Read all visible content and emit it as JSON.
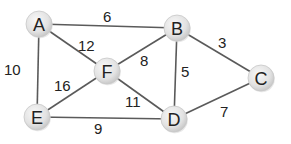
{
  "diagram": {
    "type": "weighted-undirected-graph",
    "node_radius": 13,
    "colors": {
      "edge": "#5a5a5a",
      "node_fill_light": "#f6f6f6",
      "node_fill_dark": "#cfcfcf",
      "text": "#222222"
    },
    "nodes": [
      {
        "id": "A",
        "label": "A",
        "x": 39,
        "y": 24
      },
      {
        "id": "B",
        "label": "B",
        "x": 177,
        "y": 28
      },
      {
        "id": "C",
        "label": "C",
        "x": 261,
        "y": 78
      },
      {
        "id": "F",
        "label": "F",
        "x": 107,
        "y": 71
      },
      {
        "id": "E",
        "label": "E",
        "x": 37,
        "y": 117
      },
      {
        "id": "D",
        "label": "D",
        "x": 174,
        "y": 119
      }
    ],
    "edges": [
      {
        "from": "A",
        "to": "B",
        "weight": "6",
        "label_x": 103,
        "label_y": 22
      },
      {
        "from": "A",
        "to": "F",
        "weight": "12",
        "label_x": 78,
        "label_y": 51
      },
      {
        "from": "A",
        "to": "E",
        "weight": "10",
        "label_x": 4,
        "label_y": 75
      },
      {
        "from": "B",
        "to": "F",
        "weight": "8",
        "label_x": 140,
        "label_y": 66
      },
      {
        "from": "B",
        "to": "C",
        "weight": "3",
        "label_x": 218,
        "label_y": 48
      },
      {
        "from": "B",
        "to": "D",
        "weight": "5",
        "label_x": 181,
        "label_y": 77
      },
      {
        "from": "F",
        "to": "E",
        "weight": "16",
        "label_x": 54,
        "label_y": 91
      },
      {
        "from": "F",
        "to": "D",
        "weight": "11",
        "label_x": 125,
        "label_y": 107
      },
      {
        "from": "E",
        "to": "D",
        "weight": "9",
        "label_x": 94,
        "label_y": 134
      },
      {
        "from": "D",
        "to": "C",
        "weight": "7",
        "label_x": 220,
        "label_y": 117
      }
    ]
  }
}
